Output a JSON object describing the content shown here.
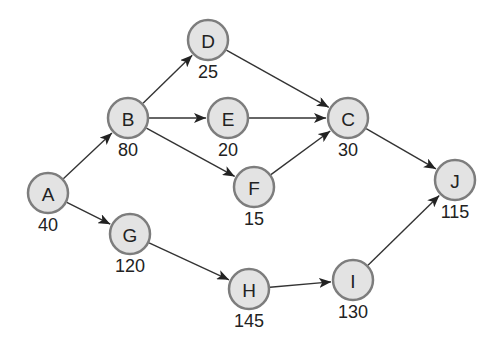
{
  "diagram": {
    "type": "directed-network",
    "nodes": [
      {
        "id": "A",
        "label": "A",
        "value": "40",
        "x": 48,
        "y": 193
      },
      {
        "id": "B",
        "label": "B",
        "value": "80",
        "x": 128,
        "y": 118
      },
      {
        "id": "D",
        "label": "D",
        "value": "25",
        "x": 208,
        "y": 40
      },
      {
        "id": "E",
        "label": "E",
        "value": "20",
        "x": 228,
        "y": 118
      },
      {
        "id": "F",
        "label": "F",
        "value": "15",
        "x": 254,
        "y": 187
      },
      {
        "id": "C",
        "label": "C",
        "value": "30",
        "x": 348,
        "y": 118
      },
      {
        "id": "G",
        "label": "G",
        "value": "120",
        "x": 130,
        "y": 234
      },
      {
        "id": "H",
        "label": "H",
        "value": "145",
        "x": 249,
        "y": 289
      },
      {
        "id": "I",
        "label": "I",
        "value": "130",
        "x": 353,
        "y": 280
      },
      {
        "id": "J",
        "label": "J",
        "value": "115",
        "x": 455,
        "y": 180
      }
    ],
    "edges": [
      {
        "from": "A",
        "to": "B"
      },
      {
        "from": "A",
        "to": "G"
      },
      {
        "from": "B",
        "to": "D"
      },
      {
        "from": "B",
        "to": "E"
      },
      {
        "from": "B",
        "to": "F"
      },
      {
        "from": "D",
        "to": "C"
      },
      {
        "from": "E",
        "to": "C"
      },
      {
        "from": "F",
        "to": "C"
      },
      {
        "from": "C",
        "to": "J"
      },
      {
        "from": "G",
        "to": "H"
      },
      {
        "from": "H",
        "to": "I"
      },
      {
        "from": "I",
        "to": "J"
      }
    ],
    "node_radius": 20,
    "colors": {
      "node_fill": "#e3e3e3",
      "node_stroke": "#7d7d7d",
      "edge": "#333333",
      "text": "#222222"
    }
  }
}
